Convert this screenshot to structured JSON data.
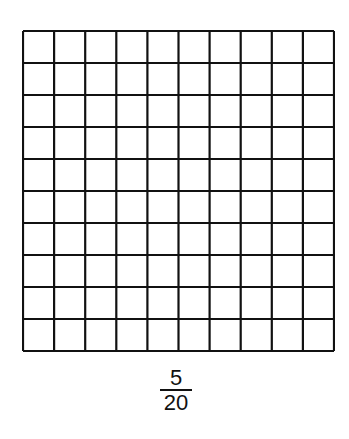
{
  "grid": {
    "rows": 10,
    "cols": 10,
    "shaded_cells": 0,
    "line_color": "#111111",
    "fill_color": "#ffffff"
  },
  "fraction": {
    "numerator": "5",
    "denominator": "20"
  }
}
